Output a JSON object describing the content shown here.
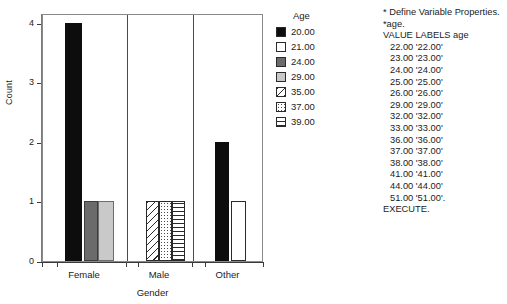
{
  "chart_data": {
    "type": "bar",
    "title": "",
    "xlabel": "Gender",
    "ylabel": "Count",
    "ylim": [
      0,
      4
    ],
    "yticks": [
      "0",
      "1",
      "2",
      "3",
      "4"
    ],
    "grid": false,
    "legend_position": "right",
    "legend_title": "Age",
    "categories": [
      "Female",
      "Male",
      "Other"
    ],
    "series": [
      {
        "name": "20.00",
        "pattern": "solid-black",
        "color": "#0d0d0d",
        "values": [
          4,
          0,
          2
        ]
      },
      {
        "name": "21.00",
        "pattern": "solid-white",
        "color": "#ffffff",
        "values": [
          0,
          0,
          1
        ]
      },
      {
        "name": "24.00",
        "pattern": "solid-dark-gray",
        "color": "#6b6b6b",
        "values": [
          1,
          0,
          0
        ]
      },
      {
        "name": "29.00",
        "pattern": "solid-light-gray",
        "color": "#c9c9c9",
        "values": [
          1,
          0,
          0
        ]
      },
      {
        "name": "35.00",
        "pattern": "diagonal-hatch",
        "color": "#ffffff",
        "values": [
          0,
          1,
          0
        ]
      },
      {
        "name": "37.00",
        "pattern": "dotted",
        "color": "#ffffff",
        "values": [
          0,
          1,
          0
        ]
      },
      {
        "name": "39.00",
        "pattern": "horizontal-lines",
        "color": "#ffffff",
        "values": [
          0,
          1,
          0
        ]
      }
    ],
    "bars": [
      {
        "group": "Female",
        "series": "20.00",
        "value": 4,
        "fill": "f-black"
      },
      {
        "group": "Female",
        "series": "24.00",
        "value": 1,
        "fill": "f-dgray"
      },
      {
        "group": "Female",
        "series": "29.00",
        "value": 1,
        "fill": "f-lgray"
      },
      {
        "group": "Male",
        "series": "35.00",
        "value": 1,
        "fill": "f-diag"
      },
      {
        "group": "Male",
        "series": "37.00",
        "value": 1,
        "fill": "f-dots"
      },
      {
        "group": "Male",
        "series": "39.00",
        "value": 1,
        "fill": "f-hlines"
      },
      {
        "group": "Other",
        "series": "20.00",
        "value": 2,
        "fill": "f-black"
      },
      {
        "group": "Other",
        "series": "21.00",
        "value": 1,
        "fill": "f-white"
      }
    ]
  },
  "legend": {
    "title": "Age",
    "items": [
      {
        "label": "20.00",
        "fill": "f-black"
      },
      {
        "label": "21.00",
        "fill": "f-white"
      },
      {
        "label": "24.00",
        "fill": "f-dgray"
      },
      {
        "label": "29.00",
        "fill": "f-lgray"
      },
      {
        "label": "35.00",
        "fill": "f-diag"
      },
      {
        "label": "37.00",
        "fill": "f-dots"
      },
      {
        "label": "39.00",
        "fill": "f-hlines"
      }
    ]
  },
  "axes": {
    "ylabel": "Count",
    "xlabel": "Gender",
    "yticks": [
      "4",
      "3",
      "2",
      "1",
      "0"
    ],
    "xcategories": [
      "Female",
      "Male",
      "Other"
    ]
  },
  "syntax": {
    "lines": [
      {
        "text": "* Define Variable Properties.",
        "indent": false
      },
      {
        "text": "*age.",
        "indent": false
      },
      {
        "text": "VALUE LABELS age",
        "indent": false
      },
      {
        "text": "22.00 '22.00'",
        "indent": true
      },
      {
        "text": "23.00 '23.00'",
        "indent": true
      },
      {
        "text": "24.00 '24.00'",
        "indent": true
      },
      {
        "text": "25.00 '25.00'",
        "indent": true
      },
      {
        "text": "26.00 '26.00'",
        "indent": true
      },
      {
        "text": "29.00 '29.00'",
        "indent": true
      },
      {
        "text": "32.00 '32.00'",
        "indent": true
      },
      {
        "text": "33.00 '33.00'",
        "indent": true
      },
      {
        "text": "36.00 '36.00'",
        "indent": true
      },
      {
        "text": "37.00 '37.00'",
        "indent": true
      },
      {
        "text": "38.00 '38.00'",
        "indent": true
      },
      {
        "text": "41.00 '41.00'",
        "indent": true
      },
      {
        "text": "44.00 '44.00'",
        "indent": true
      },
      {
        "text": "51.00 '51.00'.",
        "indent": true
      },
      {
        "text": "EXECUTE.",
        "indent": false
      }
    ]
  }
}
